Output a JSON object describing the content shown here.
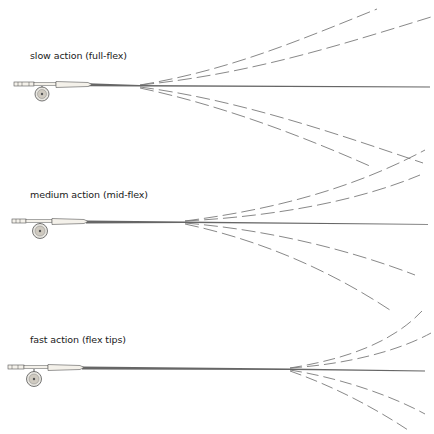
{
  "diagram": {
    "colors": {
      "rod": "#6e6e6e",
      "flex_line": "#7a7a7a",
      "handle": "#f4f1ea",
      "outline": "#555555"
    },
    "rods": [
      {
        "label": "slow action (full-flex)",
        "label_pos": [
          30,
          49
        ],
        "rod_y": 85,
        "flex_point_x": 140,
        "reel": [
          42,
          93
        ],
        "curves": [
          "M140,85 C230,70 300,40 377,9",
          "M140,85 C250,74 340,45 431,17",
          "M140,87 C240,100 340,135 423,163",
          "M140,88 C220,105 300,135 372,167"
        ]
      },
      {
        "label": "medium action (mid-flex)",
        "label_pos": [
          30,
          188
        ],
        "rod_y": 222,
        "flex_point_x": 185,
        "reel": [
          42,
          230
        ],
        "curves": [
          "M185,221 C270,210 350,190 425,150",
          "M185,221 C280,216 360,200 420,175",
          "M185,223 C270,230 350,250 415,275",
          "M185,224 C260,240 330,270 393,312"
        ]
      },
      {
        "label": "fast action (flex tips)",
        "label_pos": [
          30,
          333
        ],
        "rod_y": 369,
        "flex_point_x": 290,
        "reel": [
          36,
          382
        ],
        "curves": [
          "M290,368 C340,360 390,345 422,311",
          "M290,368 C350,364 400,350 431,333",
          "M290,370 C340,378 390,395 425,414",
          "M290,371 C330,385 370,405 408,430"
        ]
      }
    ]
  }
}
